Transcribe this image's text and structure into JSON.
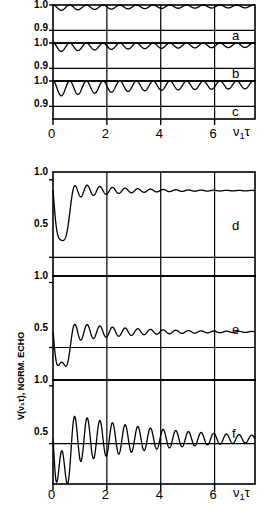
{
  "figure": {
    "y_axis_title": "V(ν₁τ), NORM. ECHO",
    "x_axis_title_main": "ν",
    "x_axis_title_sub": "1",
    "x_axis_title_tail": "τ"
  },
  "upper": {
    "ytick_labels": [
      "1.0",
      "0.9",
      "1.0",
      "0.9",
      "1.0",
      "0.9"
    ],
    "xtick_labels": [
      "0",
      "2",
      "4",
      "6"
    ],
    "panel_labels": [
      "a",
      "b",
      "c"
    ]
  },
  "lower": {
    "ytick_labels": [
      "1.0",
      "0.5",
      "1.0",
      "0.5",
      "1.0",
      "0.5"
    ],
    "xtick_labels": [
      "0",
      "2",
      "4",
      "6"
    ],
    "panel_labels": [
      "d",
      "e",
      "f"
    ]
  },
  "chart_data": {
    "type": "line",
    "title": "",
    "xlabel": "ν₁τ",
    "ylabel": "V(ν₁τ), NORM. ECHO",
    "xlim": [
      0,
      7.5
    ],
    "xticks": [
      0,
      2,
      4,
      6
    ],
    "grid": true,
    "panels": [
      {
        "label": "a",
        "ylim": [
          0.85,
          1.0
        ],
        "yticks": [
          1.0,
          0.9
        ],
        "baseline": 1.0,
        "depth": 0.022,
        "period": 0.62,
        "damping": 0.3,
        "description": "Shallow periodic modulation just below 1.0"
      },
      {
        "label": "b",
        "ylim": [
          0.85,
          1.0
        ],
        "yticks": [
          1.0,
          0.9
        ],
        "baseline": 1.0,
        "depth": 0.035,
        "period": 0.62,
        "damping": 0.32,
        "description": "Moderate periodic modulation below 1.0"
      },
      {
        "label": "c",
        "ylim": [
          0.85,
          1.0
        ],
        "yticks": [
          1.0,
          0.9
        ],
        "baseline": 1.0,
        "depth": 0.062,
        "period": 0.62,
        "damping": 0.34,
        "description": "Deepest modulation of upper set, dips near 0.9"
      },
      {
        "label": "d",
        "ylim": [
          0.38,
          1.05
        ],
        "yticks": [
          1.0,
          0.5
        ],
        "baseline": 0.93,
        "first_dip": 0.55,
        "depth": 0.07,
        "period": 0.47,
        "damping": 0.55,
        "description": "Deep initial dip to ~0.55 then damped ripples near 0.93"
      },
      {
        "label": "e",
        "ylim": [
          0.25,
          1.05
        ],
        "yticks": [
          1.0,
          0.5
        ],
        "baseline": 0.62,
        "first_dip": 0.3,
        "depth": 0.1,
        "period": 0.47,
        "damping": 0.45,
        "description": "Deep dip below 0.5 then damped oscillation toward 0.62"
      },
      {
        "label": "f",
        "ylim": [
          0.15,
          1.05
        ],
        "yticks": [
          1.0,
          0.5
        ],
        "baseline": 0.54,
        "first_dip": 0.2,
        "depth": 0.26,
        "period": 0.47,
        "damping": 0.28,
        "description": "Largest amplitude oscillation about 0.5 baseline"
      }
    ]
  }
}
